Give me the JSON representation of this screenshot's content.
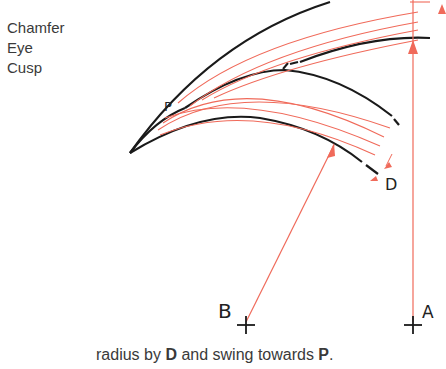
{
  "legend": {
    "items": [
      "Chamfer",
      "Eye",
      "Cusp"
    ]
  },
  "labels": {
    "p": "P",
    "d": "D",
    "b": "B",
    "a": "A"
  },
  "caption": {
    "prefix": "radius by ",
    "bold1": "D",
    "middle": " and swing towards ",
    "bold2": "P",
    "suffix": "."
  },
  "colors": {
    "outline": "#1a1a1a",
    "construction": "#f06a5a",
    "text": "#3a3a3a"
  }
}
